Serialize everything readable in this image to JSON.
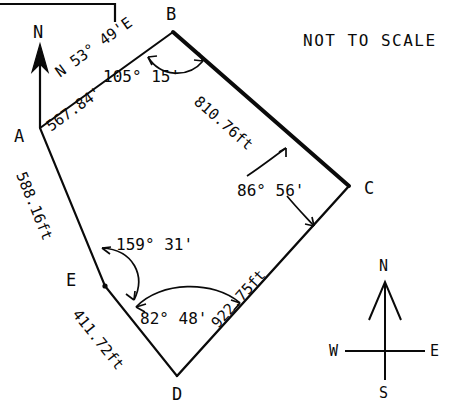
{
  "diagram": {
    "title_note": "NOT TO SCALE",
    "vertices": [
      {
        "id": "A",
        "label": "A",
        "x": 40,
        "y": 128,
        "label_x": 14,
        "label_y": 136
      },
      {
        "id": "B",
        "label": "B",
        "x": 173,
        "y": 32,
        "label_x": 168,
        "label_y": 14
      },
      {
        "id": "C",
        "label": "C",
        "x": 349,
        "y": 186,
        "label_x": 364,
        "label_y": 192
      },
      {
        "id": "D",
        "label": "D",
        "x": 177,
        "y": 376,
        "label_x": 173,
        "label_y": 396
      },
      {
        "id": "E",
        "label": "E",
        "x": 105,
        "y": 286,
        "label_x": 68,
        "label_y": 283
      }
    ],
    "sides": [
      {
        "from": "A",
        "to": "B",
        "distance": "567.84'",
        "bearing": "N 53° 49'E",
        "weight": "thin"
      },
      {
        "from": "B",
        "to": "C",
        "distance": "810.76ft",
        "bearing": "",
        "weight": "bold"
      },
      {
        "from": "C",
        "to": "D",
        "distance": "922.75ft",
        "bearing": "",
        "weight": "thin"
      },
      {
        "from": "D",
        "to": "E",
        "distance": "411.72ft",
        "bearing": "",
        "weight": "thin"
      },
      {
        "from": "E",
        "to": "A",
        "distance": "588.16ft",
        "bearing": "",
        "weight": "thin"
      }
    ],
    "angles": [
      {
        "at": "B",
        "value": "105° 15'",
        "label_x": 106,
        "label_y": 70
      },
      {
        "at": "C",
        "value": "86° 56'",
        "label_x": 239,
        "label_y": 184
      },
      {
        "at": "E",
        "value": "159° 31'",
        "label_x": 118,
        "label_y": 238
      },
      {
        "at": "D",
        "value": "82° 48'",
        "label_x": 141,
        "label_y": 312
      }
    ],
    "north_arrow": {
      "label": "N",
      "tip_x": 40,
      "tip_y": 48,
      "base_x": 40,
      "base_y": 128,
      "label_x": 34,
      "label_y": 26
    },
    "compass_rose": {
      "north": "N",
      "south": "S",
      "east": "E",
      "west": "W",
      "center_x": 385,
      "center_y": 351
    }
  }
}
